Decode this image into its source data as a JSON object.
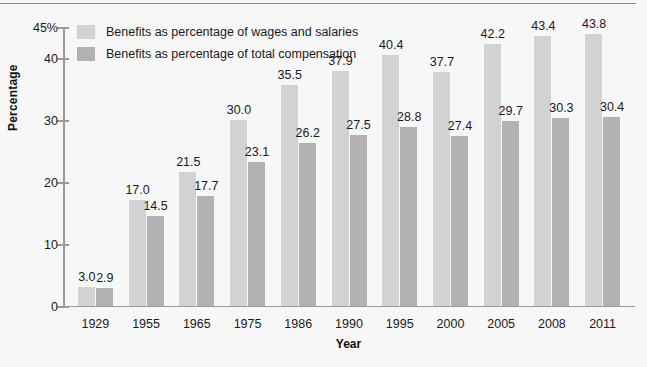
{
  "chart_data": {
    "type": "bar",
    "title": "",
    "xlabel": "Year",
    "ylabel": "Percentage",
    "categories": [
      "1929",
      "1955",
      "1965",
      "1975",
      "1986",
      "1990",
      "1995",
      "2000",
      "2005",
      "2008",
      "2011"
    ],
    "series": [
      {
        "name": "Benefits as percentage of wages and salaries",
        "color": "#d2d2d2",
        "values": [
          3.0,
          17.0,
          21.5,
          30.0,
          35.5,
          37.9,
          40.4,
          37.7,
          42.2,
          43.4,
          43.8
        ],
        "labels": [
          "3.0",
          "17.0",
          "21.5",
          "30.0",
          "35.5",
          "37.9",
          "40.4",
          "37.7",
          "42.2",
          "43.4",
          "43.8"
        ]
      },
      {
        "name": "Benefits as percentage of total compensation",
        "color": "#b2b2b2",
        "values": [
          2.9,
          14.5,
          17.7,
          23.1,
          26.2,
          27.5,
          28.8,
          27.4,
          29.7,
          30.3,
          30.4
        ],
        "labels": [
          "2.9",
          "14.5",
          "17.7",
          "23.1",
          "26.2",
          "27.5",
          "28.8",
          "27.4",
          "29.7",
          "30.3",
          "30.4"
        ]
      }
    ],
    "ylim": [
      0,
      45
    ],
    "yticks": [
      0,
      10,
      20,
      30,
      40,
      45
    ],
    "ytick_labels": [
      "0",
      "10",
      "20",
      "30",
      "40",
      "45%"
    ],
    "grid": false,
    "legend_position": "top-left"
  },
  "axes": {
    "y_title": "Percentage",
    "x_title": "Year"
  },
  "legend": {
    "items": [
      {
        "label": "Benefits as percentage of wages and salaries",
        "color": "#d2d2d2"
      },
      {
        "label": "Benefits as percentage of total compensation",
        "color": "#b2b2b2"
      }
    ]
  },
  "colors": {
    "background": "#f7f7f7",
    "axis": "#9a9a9a",
    "text": "#1a1a1a",
    "series_light": "#d2d2d2",
    "series_dark": "#b2b2b2",
    "top_rule": "#8a8a8a"
  }
}
